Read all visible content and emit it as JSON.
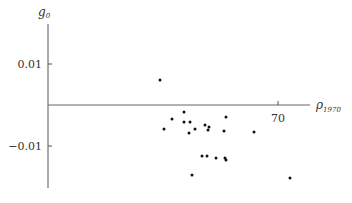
{
  "chart_data": {
    "type": "scatter",
    "title": "",
    "xlabel": "ρ",
    "xlabel_sub": "1970",
    "ylabel": "g",
    "ylabel_sub": "0",
    "x_ticks": [
      {
        "label": "70",
        "px": 278
      }
    ],
    "y_ticks": [
      {
        "label": "0.01",
        "value": 0.01,
        "px": 64
      },
      {
        "label": "−0.01",
        "value": -0.01,
        "px": 146
      }
    ],
    "grid": false,
    "legend": null,
    "axes_px": {
      "y_axis_x": 48,
      "x_axis_y": 105,
      "y_axis_top": 24,
      "y_axis_bottom": 188,
      "x_axis_right": 310
    },
    "points_px": [
      [
        160,
        80
      ],
      [
        184,
        112
      ],
      [
        172,
        119
      ],
      [
        184,
        122
      ],
      [
        190,
        122
      ],
      [
        205,
        125
      ],
      [
        226,
        117
      ],
      [
        164,
        129
      ],
      [
        195,
        129
      ],
      [
        189,
        133
      ],
      [
        208,
        130
      ],
      [
        224,
        131
      ],
      [
        254,
        132
      ],
      [
        202,
        156
      ],
      [
        207,
        156
      ],
      [
        216,
        158
      ],
      [
        225,
        158
      ],
      [
        226,
        160
      ],
      [
        192,
        175
      ],
      [
        290,
        178
      ],
      [
        209,
        127
      ]
    ],
    "points_y_values": [
      0.0061,
      -0.0017,
      -0.0034,
      -0.0041,
      -0.0041,
      -0.0049,
      -0.0029,
      -0.0059,
      -0.0059,
      -0.0068,
      -0.0061,
      -0.0063,
      -0.0066,
      -0.0124,
      -0.0124,
      -0.0129,
      -0.0129,
      -0.0134,
      -0.0171,
      -0.0178,
      -0.0054
    ]
  }
}
